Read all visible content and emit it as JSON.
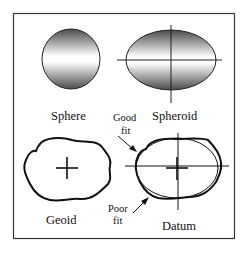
{
  "labels": {
    "sphere": "Sphere",
    "spheroid": "Spheroid",
    "geoid": "Geoid",
    "datum": "Datum",
    "good_fit_line1": "Good",
    "good_fit_line2": "fit",
    "poor_fit_line1": "Poor",
    "poor_fit_line2": "fit"
  },
  "colors": {
    "frame": "#333333",
    "stroke": "#111111",
    "gradient_dark": "#555555",
    "gradient_light": "#ffffff"
  }
}
